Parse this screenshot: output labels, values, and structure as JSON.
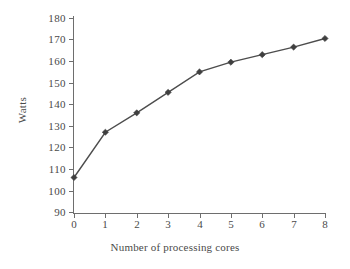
{
  "chart_data": {
    "type": "line",
    "title": "",
    "subtitle": "",
    "xlabel": "Number of processing cores",
    "ylabel": "Watts",
    "x": [
      0,
      1,
      2,
      3,
      4,
      5,
      6,
      7,
      8
    ],
    "categories": [
      "0",
      "1",
      "2",
      "3",
      "4",
      "5",
      "6",
      "7",
      "8"
    ],
    "values": [
      106,
      127,
      136,
      145.5,
      155,
      159.5,
      163,
      166.5,
      170.5
    ],
    "series": [
      {
        "name": "Power consumption",
        "values": [
          106,
          127,
          136,
          145.5,
          155,
          159.5,
          163,
          166.5,
          170.5
        ]
      }
    ],
    "xlim": [
      0,
      8
    ],
    "ylim": [
      90,
      180
    ],
    "xticks": [
      "0",
      "1",
      "2",
      "3",
      "4",
      "5",
      "6",
      "7",
      "8"
    ],
    "yticks": [
      "180",
      "170",
      "160",
      "150",
      "140",
      "130",
      "120",
      "110",
      "100",
      "90"
    ],
    "grid": false,
    "legend": null,
    "legend_position": "none",
    "marker": "diamond",
    "line_color": "#4d4d4d",
    "marker_color": "#3f3f3f",
    "background_color": "#ffffff"
  },
  "axes": {
    "y_title": "Watts",
    "x_title": "Number of processing cores",
    "y_tick_labels": [
      "180",
      "170",
      "160",
      "150",
      "140",
      "130",
      "120",
      "110",
      "100",
      "90"
    ],
    "x_tick_labels": [
      "0",
      "1",
      "2",
      "3",
      "4",
      "5",
      "6",
      "7",
      "8"
    ]
  }
}
